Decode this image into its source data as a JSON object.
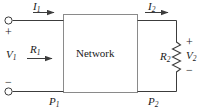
{
  "figure": {
    "type": "two-port-network-circuit-diagram",
    "network_box": {
      "label": "Network",
      "x": 63,
      "y": 14,
      "width": 75,
      "height": 79
    },
    "line_color": "#3c3c3c",
    "text_color": "#1a1a1a",
    "background": "#ffffff",
    "labels": {
      "current_in": {
        "symbol": "I",
        "subscript": "1",
        "text": "I1"
      },
      "current_out": {
        "symbol": "I",
        "subscript": "2",
        "text": "I2"
      },
      "voltage_in": {
        "symbol": "V",
        "subscript": "1",
        "text": "V1"
      },
      "voltage_out": {
        "symbol": "V",
        "subscript": "2",
        "text": "V2"
      },
      "resistance_in": {
        "symbol": "R",
        "subscript": "1",
        "text": "R1"
      },
      "resistance_load": {
        "symbol": "R",
        "subscript": "2",
        "text": "R2"
      },
      "power_in": {
        "symbol": "P",
        "subscript": "1",
        "text": "P1"
      },
      "power_out": {
        "symbol": "P",
        "subscript": "2",
        "text": "P2"
      }
    },
    "polarity": {
      "input_top": "+",
      "input_bottom": "−",
      "output_top": "+",
      "output_bottom": "−"
    },
    "terminals": [
      {
        "name": "input-top-terminal",
        "x": 8,
        "y": 20
      },
      {
        "name": "input-bottom-terminal",
        "x": 8,
        "y": 91
      }
    ],
    "arrows": [
      {
        "name": "current-in-arrow",
        "x1": 33,
        "y1": 12,
        "x2": 61,
        "y2": 12
      },
      {
        "name": "resistance-in-arrow",
        "x1": 27,
        "y1": 58,
        "x2": 59,
        "y2": 58
      },
      {
        "name": "current-out-arrow",
        "x1": 145,
        "y1": 12,
        "x2": 175,
        "y2": 12
      }
    ],
    "resistor": {
      "name": "load-resistor-R2",
      "x": 176,
      "y_top": 42,
      "y_bottom": 72,
      "zigzag_amplitude": 4
    }
  }
}
